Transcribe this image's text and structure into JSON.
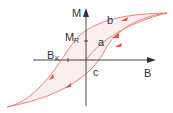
{
  "diagram": {
    "axes": {
      "x_label": "B",
      "y_label": "M"
    },
    "points": {
      "remanence": {
        "label": "M",
        "subscript": "R"
      },
      "coercivity": {
        "label": "B",
        "subscript": "K"
      }
    },
    "curve_labels": {
      "a": "a",
      "b": "b",
      "c": "c"
    },
    "colors": {
      "curve": "#e8776a",
      "fill": "#fbeeee",
      "arrow": "#e05545",
      "axis": "#333333"
    }
  }
}
